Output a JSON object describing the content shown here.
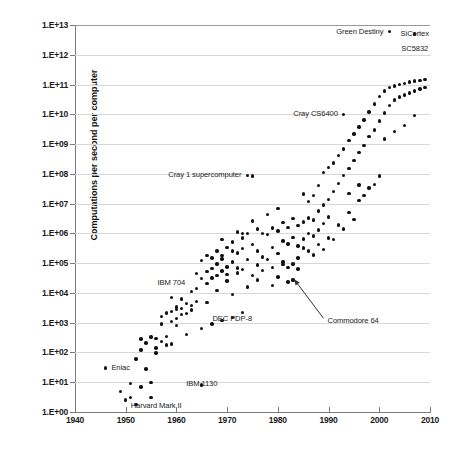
{
  "chart_data": {
    "type": "scatter",
    "title": "",
    "xlabel": "",
    "ylabel": "Computations per second per computer",
    "xlim": [
      1940,
      2010
    ],
    "ylim": [
      1,
      10000000000000
    ],
    "yscale": "log",
    "grid": true,
    "legend": "none",
    "x_ticks": [
      "1940",
      "1950",
      "1960",
      "1970",
      "1980",
      "1990",
      "2000",
      "2010"
    ],
    "y_ticks": [
      "1.E+00",
      "1.E+01",
      "1.E+02",
      "1.E+03",
      "1.E+04",
      "1.E+05",
      "1.E+06",
      "1.E+07",
      "1.E+08",
      "1.E+09",
      "1.E+10",
      "1.E+11",
      "1.E+12",
      "1.E+13"
    ],
    "annotations": [
      {
        "label": "Green Destiny",
        "x": 2002,
        "y": 6000000000000.0,
        "align": "right"
      },
      {
        "label": "SiCortex",
        "x": 2007,
        "y": 5000000000000.0,
        "align": "center"
      },
      {
        "label": "SC5832",
        "x": 2007,
        "y": 1600000000000.0,
        "align": "center"
      },
      {
        "label": "Cray CS6400",
        "x": 1993,
        "y": 10000000000.0,
        "align": "right"
      },
      {
        "label": "Cray 1 supercomputer",
        "x": 1974,
        "y": 90000000.0,
        "align": "right"
      },
      {
        "label": "IBM 704",
        "x": 1959,
        "y": 22000.0,
        "align": "center"
      },
      {
        "label": "DEC PDP-8",
        "x": 1971,
        "y": 1300.0,
        "align": "center"
      },
      {
        "label": "Commodore 64",
        "x": 1989,
        "y": 1100.0,
        "align": "left"
      },
      {
        "label": "Eniac",
        "x": 1949,
        "y": 30.0,
        "align": "center"
      },
      {
        "label": "IBM 1130",
        "x": 1965,
        "y": 9.0,
        "align": "center"
      },
      {
        "label": "Harvard Mark II",
        "x": 1956,
        "y": 1.6,
        "align": "center"
      }
    ],
    "points": [
      [
        1946,
        30
      ],
      [
        1949,
        5
      ],
      [
        1950,
        2.5
      ],
      [
        1951,
        3
      ],
      [
        1952,
        60
      ],
      [
        1952,
        1.8
      ],
      [
        1953,
        280
      ],
      [
        1953,
        120
      ],
      [
        1954,
        210
      ],
      [
        1954,
        28
      ],
      [
        1955,
        3
      ],
      [
        1955,
        330
      ],
      [
        1956,
        290
      ],
      [
        1956,
        140
      ],
      [
        1957,
        1600
      ],
      [
        1957,
        900
      ],
      [
        1958,
        2100
      ],
      [
        1958,
        180
      ],
      [
        1959,
        7000
      ],
      [
        1959,
        2400
      ],
      [
        1959,
        1100
      ],
      [
        1960,
        3400
      ],
      [
        1960,
        2800
      ],
      [
        1960,
        1400
      ],
      [
        1960,
        820
      ],
      [
        1961,
        6200
      ],
      [
        1961,
        3000
      ],
      [
        1962,
        4400
      ],
      [
        1962,
        2000
      ],
      [
        1963,
        11000
      ],
      [
        1963,
        3800
      ],
      [
        1964,
        46000
      ],
      [
        1964,
        14000
      ],
      [
        1964,
        5200
      ],
      [
        1965,
        120000
      ],
      [
        1965,
        30000
      ],
      [
        1965,
        8
      ],
      [
        1966,
        180000
      ],
      [
        1966,
        52000
      ],
      [
        1966,
        21000
      ],
      [
        1967,
        150000
      ],
      [
        1967,
        66000
      ],
      [
        1967,
        32000
      ],
      [
        1968,
        260000
      ],
      [
        1968,
        95000
      ],
      [
        1968,
        38000
      ],
      [
        1969,
        620000
      ],
      [
        1969,
        140000
      ],
      [
        1969,
        55000
      ],
      [
        1970,
        330000
      ],
      [
        1970,
        75000
      ],
      [
        1970,
        25000
      ],
      [
        1971,
        520000
      ],
      [
        1971,
        110000
      ],
      [
        1971,
        9000
      ],
      [
        1972,
        1100000
      ],
      [
        1972,
        220000
      ],
      [
        1972,
        47000
      ],
      [
        1973,
        1000000
      ],
      [
        1973,
        310000
      ],
      [
        1973,
        60000
      ],
      [
        1974,
        90000000
      ],
      [
        1974,
        980000
      ],
      [
        1974,
        130000
      ],
      [
        1975,
        85000000
      ],
      [
        1975,
        2600000
      ],
      [
        1975,
        430000
      ],
      [
        1976,
        1400000
      ],
      [
        1976,
        260000
      ],
      [
        1976,
        27000
      ],
      [
        1977,
        1000000
      ],
      [
        1977,
        160000
      ],
      [
        1978,
        4300000
      ],
      [
        1978,
        900000
      ],
      [
        1979,
        1500000
      ],
      [
        1979,
        340000
      ],
      [
        1979,
        18000
      ],
      [
        1980,
        6800000
      ],
      [
        1980,
        1200000
      ],
      [
        1980,
        210000
      ],
      [
        1981,
        2300000
      ],
      [
        1981,
        560000
      ],
      [
        1981,
        92000
      ],
      [
        1982,
        1600000
      ],
      [
        1982,
        440000
      ],
      [
        1982,
        23000
      ],
      [
        1983,
        3100000
      ],
      [
        1983,
        720000
      ],
      [
        1983,
        26000
      ],
      [
        1983,
        28000
      ],
      [
        1984,
        1800000
      ],
      [
        1984,
        380000
      ],
      [
        1984,
        64000
      ],
      [
        1985,
        21000000
      ],
      [
        1985,
        2400000
      ],
      [
        1985,
        640000
      ],
      [
        1986,
        12000000
      ],
      [
        1986,
        3300000
      ],
      [
        1986,
        980000
      ],
      [
        1987,
        19000000
      ],
      [
        1987,
        2800000
      ],
      [
        1987,
        820000
      ],
      [
        1988,
        41000000
      ],
      [
        1988,
        5600000
      ],
      [
        1988,
        1300000
      ],
      [
        1989,
        110000000
      ],
      [
        1989,
        9000000
      ],
      [
        1989,
        2100000
      ],
      [
        1990,
        160000000
      ],
      [
        1990,
        14000000
      ],
      [
        1990,
        3600000
      ],
      [
        1991,
        230000000
      ],
      [
        1991,
        26000000
      ],
      [
        1992,
        420000000
      ],
      [
        1992,
        48000000
      ],
      [
        1993,
        10000000000
      ],
      [
        1993,
        680000000
      ],
      [
        1993,
        90000000
      ],
      [
        1994,
        1300000000
      ],
      [
        1994,
        150000000
      ],
      [
        1995,
        2200000000
      ],
      [
        1995,
        280000000
      ],
      [
        1996,
        3800000000
      ],
      [
        1996,
        520000000
      ],
      [
        1997,
        6500000000
      ],
      [
        1997,
        900000000
      ],
      [
        1998,
        12000000000
      ],
      [
        1998,
        1800000000
      ],
      [
        1999,
        22000000000
      ],
      [
        1999,
        3000000000
      ],
      [
        2000,
        40000000000
      ],
      [
        2000,
        6000000000
      ],
      [
        2001,
        60000000000
      ],
      [
        2001,
        11000000000
      ],
      [
        2002,
        6000000000000
      ],
      [
        2002,
        80000000000
      ],
      [
        2002,
        20000000000
      ],
      [
        2003,
        90000000000
      ],
      [
        2003,
        30000000000
      ],
      [
        2004,
        100000000000
      ],
      [
        2004,
        38000000000
      ],
      [
        2005,
        110000000000
      ],
      [
        2005,
        45000000000
      ],
      [
        2006,
        120000000000
      ],
      [
        2006,
        52000000000
      ],
      [
        2007,
        5000000000000
      ],
      [
        2007,
        130000000000
      ],
      [
        2007,
        60000000000
      ],
      [
        2008,
        140000000000
      ],
      [
        2008,
        70000000000
      ],
      [
        2009,
        150000000000
      ],
      [
        2009,
        80000000000
      ],
      [
        1951,
        9
      ],
      [
        1953,
        7
      ],
      [
        1955,
        10
      ],
      [
        1957,
        230
      ],
      [
        1958,
        340
      ],
      [
        1961,
        1900
      ],
      [
        1963,
        2700
      ],
      [
        1966,
        4800
      ],
      [
        1968,
        12000
      ],
      [
        1970,
        41000
      ],
      [
        1972,
        68000
      ],
      [
        1974,
        16000
      ],
      [
        1976,
        88000
      ],
      [
        1978,
        130000
      ],
      [
        1980,
        34000
      ],
      [
        1982,
        71000
      ],
      [
        1984,
        150000
      ],
      [
        1986,
        260000
      ],
      [
        1988,
        420000
      ],
      [
        1990,
        700000
      ],
      [
        1992,
        1900000
      ],
      [
        1994,
        5000000
      ],
      [
        1996,
        13000000
      ],
      [
        1998,
        33000000
      ],
      [
        2000,
        85000000
      ],
      [
        1969,
        1200
      ],
      [
        1971,
        1500
      ],
      [
        1973,
        2200
      ],
      [
        1967,
        900
      ],
      [
        1965,
        640
      ],
      [
        1962,
        400
      ],
      [
        1959,
        190
      ],
      [
        1956,
        95
      ],
      [
        1985,
        320000
      ],
      [
        1987,
        190000
      ],
      [
        1989,
        290000
      ],
      [
        1991,
        620000
      ],
      [
        1993,
        1400000
      ],
      [
        1995,
        2900000
      ],
      [
        1981,
        110000
      ],
      [
        1983,
        95000
      ],
      [
        1979,
        72000
      ],
      [
        1977,
        58000
      ],
      [
        1975,
        39000
      ],
      [
        1973,
        700000
      ],
      [
        1971,
        260000
      ],
      [
        1969,
        180000
      ],
      [
        2001,
        1500000000
      ],
      [
        2003,
        2600000000
      ],
      [
        2005,
        4200000000
      ],
      [
        2007,
        9000000000
      ],
      [
        1997,
        19000000
      ],
      [
        1999,
        44000000
      ],
      [
        1996,
        42000000
      ],
      [
        1994,
        22000000
      ]
    ]
  },
  "annotation_arrow": {
    "name": "commodore-64-leader-line",
    "from_x": 1989,
    "from_y": 1400.0,
    "to_x": 1983.2,
    "to_y": 29000.0
  }
}
